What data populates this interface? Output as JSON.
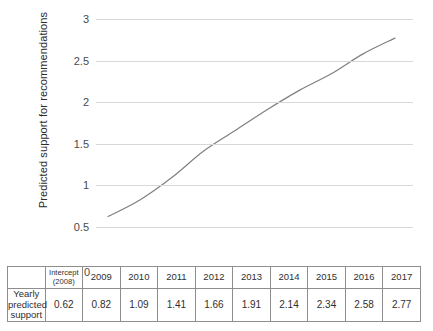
{
  "chart_data": {
    "type": "line",
    "title": "",
    "xlabel": "",
    "ylabel": "Predicted support for recommendations",
    "ylim": [
      0,
      3
    ],
    "ytick_labels": [
      "3",
      "2.5",
      "2",
      "1.5",
      "1",
      "0.5",
      "0"
    ],
    "ytick_values": [
      3,
      2.5,
      2,
      1.5,
      1,
      0.5,
      0
    ],
    "grid": true,
    "legend": "none",
    "line_color": "#808080",
    "categories": [
      "Intercept (2008)",
      "2009",
      "2010",
      "2011",
      "2012",
      "2013",
      "2014",
      "2015",
      "2016",
      "2017"
    ],
    "x": [
      2008,
      2009,
      2010,
      2011,
      2012,
      2013,
      2014,
      2015,
      2016,
      2017
    ],
    "series": [
      {
        "name": "Yearly predicted support",
        "values": [
          0.62,
          0.82,
          1.09,
          1.41,
          1.66,
          1.91,
          2.14,
          2.34,
          2.58,
          2.77
        ]
      }
    ]
  },
  "axis": {
    "y_title": "Predicted support for recommendations",
    "ticks": [
      "3",
      "2.5",
      "2",
      "1.5",
      "1",
      "0.5",
      "0"
    ]
  },
  "table": {
    "row_label": {
      "line1": "Yearly predicted",
      "line2": "support"
    },
    "headers": [
      {
        "line1": "Intercept",
        "line2": "(2008)"
      },
      {
        "line1": "2009",
        "line2": ""
      },
      {
        "line1": "2010",
        "line2": ""
      },
      {
        "line1": "2011",
        "line2": ""
      },
      {
        "line1": "2012",
        "line2": ""
      },
      {
        "line1": "2013",
        "line2": ""
      },
      {
        "line1": "2014",
        "line2": ""
      },
      {
        "line1": "2015",
        "line2": ""
      },
      {
        "line1": "2016",
        "line2": ""
      },
      {
        "line1": "2017",
        "line2": ""
      }
    ],
    "values": [
      "0.62",
      "0.82",
      "1.09",
      "1.41",
      "1.66",
      "1.91",
      "2.14",
      "2.34",
      "2.58",
      "2.77"
    ]
  },
  "colors": {
    "line": "#808080",
    "grid": "#d8d8d8",
    "table_border": "#8d8d8d",
    "text": "#2f2f2f"
  }
}
